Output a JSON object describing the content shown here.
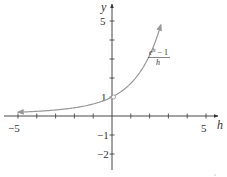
{
  "chart_data": {
    "type": "line",
    "title": "",
    "xlabel": "h",
    "ylabel": "y",
    "xlim": [
      -5.5,
      5.6
    ],
    "ylim": [
      -2.8,
      5.9
    ],
    "grid": false,
    "legend": null,
    "x_ticks": [
      -5,
      -4,
      -3,
      -2,
      -1,
      1,
      2,
      3,
      4,
      5
    ],
    "y_ticks": [
      -2,
      -1,
      1,
      2,
      3,
      4,
      5
    ],
    "x_tick_labels": [
      {
        "value": -5,
        "label": "−5"
      },
      {
        "value": 5,
        "label": "5"
      }
    ],
    "y_tick_labels": [
      {
        "value": 5,
        "label": "5"
      },
      {
        "value": 1,
        "label": "1"
      },
      {
        "value": -1,
        "label": "−1"
      },
      {
        "value": -2,
        "label": "−2"
      }
    ],
    "series": [
      {
        "name": "(e^h − 1)/h",
        "function": "(exp(h)-1)/h",
        "x": [
          -5,
          -4,
          -3,
          -2,
          -1,
          -0.5,
          0.5,
          1,
          1.5,
          2,
          2.3,
          2.6
        ],
        "values": [
          0.199,
          0.245,
          0.317,
          0.432,
          0.632,
          0.787,
          1.297,
          1.718,
          2.321,
          3.195,
          3.86,
          4.7
        ],
        "color": "#999999",
        "arrows": "both"
      }
    ],
    "annotations": [
      {
        "type": "open-circle",
        "x": 0,
        "y": 1,
        "note": "hole at h = 0"
      },
      {
        "type": "curve-label",
        "text_numerator": "e^h − 1",
        "text_denominator": "h",
        "x": 2.7,
        "y": 3.3
      }
    ]
  },
  "labels": {
    "y_axis": "y",
    "x_axis": "h",
    "tick_x_neg5": "−5",
    "tick_x_5": "5",
    "tick_y_5": "5",
    "tick_y_1": "1",
    "tick_y_neg1": "−1",
    "tick_y_neg2": "−2",
    "fn_num_base": "e",
    "fn_num_exp": "h",
    "fn_num_rest": " − 1",
    "fn_den": "h"
  },
  "colors": {
    "axis": "#333333",
    "curve": "#9a9a9a"
  }
}
